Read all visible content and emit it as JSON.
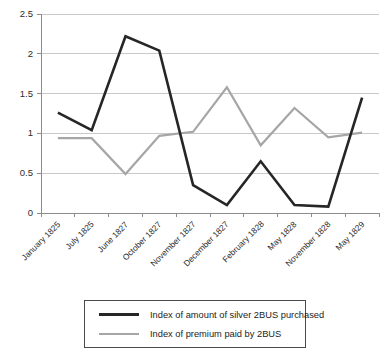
{
  "chart_data": {
    "type": "line",
    "title": "",
    "xlabel": "",
    "ylabel": "",
    "ylim": [
      0,
      2.5
    ],
    "yticks": [
      0,
      0.5,
      1,
      1.5,
      2,
      2.5
    ],
    "ytick_labels": [
      "0",
      "0.5",
      "1",
      "1.5",
      "2",
      "2.5"
    ],
    "grid": true,
    "legend_position": "bottom",
    "categories": [
      "January 1825",
      "July 1825",
      "June 1827",
      "October 1827",
      "November 1827",
      "December 1827",
      "February 1828",
      "May 1828",
      "November 1828",
      "May 1829"
    ],
    "series": [
      {
        "name": "Index of amount of silver 2BUS purchased",
        "color": "#262626",
        "values": [
          1.26,
          1.04,
          2.22,
          2.04,
          0.35,
          0.1,
          0.65,
          0.1,
          0.08,
          1.45
        ]
      },
      {
        "name": "Index of premium paid by 2BUS",
        "color": "#a6a6a6",
        "values": [
          0.94,
          0.94,
          0.49,
          0.97,
          1.02,
          1.58,
          0.85,
          1.32,
          0.95,
          1.01
        ]
      }
    ]
  },
  "legend": {
    "entries": [
      {
        "label": "Index of amount of silver 2BUS purchased"
      },
      {
        "label": "Index of premium paid by 2BUS"
      }
    ]
  }
}
